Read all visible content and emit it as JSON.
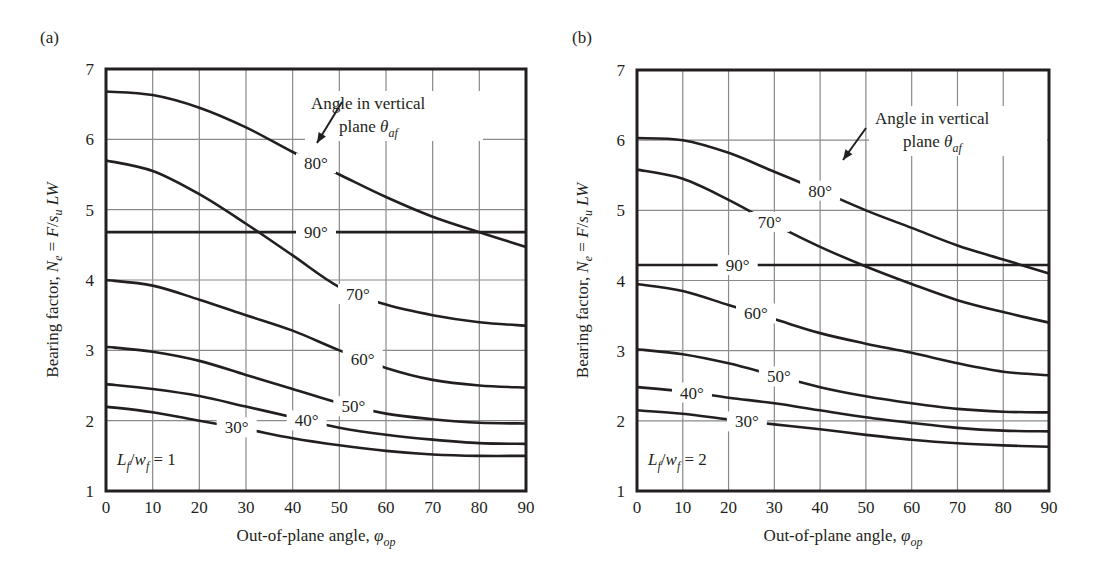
{
  "figure": {
    "panels": [
      "(a)",
      "(b)"
    ]
  },
  "chart_data": [
    {
      "type": "line",
      "panel": "(a)",
      "title": "",
      "xlabel": "Out-of-plane angle, φop",
      "ylabel": "Bearing factor, Ne = F/su LW",
      "xlim": [
        0,
        90
      ],
      "ylim": [
        1,
        7
      ],
      "grid": true,
      "x_ticks": [
        "0",
        "10",
        "20",
        "30",
        "40",
        "50",
        "60",
        "70",
        "80",
        "90"
      ],
      "y_ticks": [
        "1",
        "2",
        "3",
        "4",
        "5",
        "6",
        "7"
      ],
      "annotation": "Angle in vertical plane θaf",
      "parameter_label": "Lf/wf = 1",
      "x": [
        0,
        10,
        20,
        30,
        40,
        50,
        60,
        70,
        80,
        90
      ],
      "series": [
        {
          "name": "30°",
          "values": [
            2.2,
            2.12,
            2.0,
            1.88,
            1.75,
            1.65,
            1.57,
            1.52,
            1.5,
            1.5
          ]
        },
        {
          "name": "40°",
          "values": [
            2.52,
            2.45,
            2.35,
            2.2,
            2.05,
            1.9,
            1.8,
            1.73,
            1.68,
            1.67
          ]
        },
        {
          "name": "50°",
          "values": [
            3.05,
            2.98,
            2.85,
            2.65,
            2.45,
            2.25,
            2.1,
            2.02,
            1.97,
            1.96
          ]
        },
        {
          "name": "60°",
          "values": [
            4.0,
            3.92,
            3.72,
            3.5,
            3.28,
            3.0,
            2.75,
            2.58,
            2.5,
            2.47
          ]
        },
        {
          "name": "70°",
          "values": [
            5.7,
            5.55,
            5.22,
            4.8,
            4.35,
            3.9,
            3.65,
            3.5,
            3.4,
            3.35
          ]
        },
        {
          "name": "80°",
          "values": [
            6.68,
            6.63,
            6.45,
            6.17,
            5.82,
            5.5,
            5.18,
            4.9,
            4.68,
            4.47
          ]
        },
        {
          "name": "90°",
          "values": [
            4.68,
            4.68,
            4.68,
            4.68,
            4.68,
            4.68,
            4.68,
            4.68,
            4.68,
            4.68
          ]
        }
      ]
    },
    {
      "type": "line",
      "panel": "(b)",
      "title": "",
      "xlabel": "Out-of-plane angle, φop",
      "ylabel": "Bearing factor, Ne = F/su LW",
      "xlim": [
        0,
        90
      ],
      "ylim": [
        1,
        7
      ],
      "grid": true,
      "x_ticks": [
        "0",
        "10",
        "20",
        "30",
        "40",
        "50",
        "60",
        "70",
        "80",
        "90"
      ],
      "y_ticks": [
        "1",
        "2",
        "3",
        "4",
        "5",
        "6",
        "7"
      ],
      "annotation": "Angle in vertical plane θaf",
      "parameter_label": "Lf/wf = 2",
      "x": [
        0,
        10,
        20,
        30,
        40,
        50,
        60,
        70,
        80,
        90
      ],
      "series": [
        {
          "name": "30°",
          "values": [
            2.15,
            2.1,
            2.02,
            1.95,
            1.88,
            1.8,
            1.73,
            1.68,
            1.65,
            1.63
          ]
        },
        {
          "name": "40°",
          "values": [
            2.48,
            2.42,
            2.33,
            2.25,
            2.15,
            2.05,
            1.97,
            1.9,
            1.86,
            1.85
          ]
        },
        {
          "name": "50°",
          "values": [
            3.02,
            2.95,
            2.82,
            2.65,
            2.48,
            2.35,
            2.25,
            2.17,
            2.13,
            2.12
          ]
        },
        {
          "name": "60°",
          "values": [
            3.95,
            3.85,
            3.65,
            3.45,
            3.25,
            3.1,
            2.97,
            2.82,
            2.7,
            2.65
          ]
        },
        {
          "name": "70°",
          "values": [
            5.58,
            5.45,
            5.15,
            4.8,
            4.48,
            4.2,
            3.95,
            3.72,
            3.55,
            3.4
          ]
        },
        {
          "name": "80°",
          "values": [
            6.03,
            6.0,
            5.82,
            5.55,
            5.28,
            5.0,
            4.75,
            4.5,
            4.3,
            4.1
          ]
        },
        {
          "name": "90°",
          "values": [
            4.22,
            4.22,
            4.22,
            4.22,
            4.22,
            4.22,
            4.22,
            4.22,
            4.22,
            4.22
          ]
        }
      ]
    }
  ],
  "layout": {
    "panels": [
      {
        "left": 106,
        "right": 526,
        "top": 69,
        "bottom": 491,
        "panel_label_pos": [
          40,
          33
        ],
        "ylabel_x": 58,
        "label_pos": {
          "30°": [
            30,
            1.73
          ],
          "40°": [
            40,
            1.97
          ],
          "50°": [
            50,
            2.28
          ],
          "60°": [
            60,
            2.85
          ],
          "70°": [
            70,
            3.85
          ],
          "80°": [
            80,
            5.57
          ],
          "90°": [
            90,
            4.68
          ]
        },
        "curve_label_x": {
          "30°": 28,
          "40°": 43,
          "50°": 53,
          "60°": 55,
          "70°": 54,
          "80°": 45,
          "90°": 45
        },
        "annot_pos": [
          205,
          40
        ],
        "arrow": [
          [
            342,
            102
          ],
          [
            317,
            143
          ]
        ],
        "param_pos": [
          117,
          465
        ]
      },
      {
        "left": 637,
        "right": 1049,
        "top": 70,
        "bottom": 491,
        "panel_label_pos": [
          572,
          33
        ],
        "ylabel_x": 588,
        "curve_label_x": {
          "30°": 24,
          "40°": 12,
          "50°": 31,
          "60°": 26,
          "70°": 29,
          "80°": 40,
          "90°": 22
        },
        "annot_pos": [
          238,
          54
        ],
        "arrow": [
          [
            866,
            128
          ],
          [
            843,
            160
          ]
        ],
        "param_pos": [
          648,
          465
        ]
      }
    ]
  },
  "colors": {
    "ink": "#231f20",
    "grid": "#8a8a8a",
    "background": "#ffffff"
  }
}
